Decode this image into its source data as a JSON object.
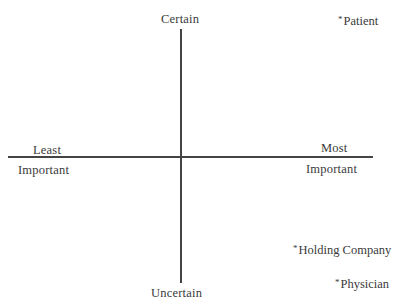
{
  "diagram": {
    "type": "quadrant",
    "axes": {
      "vertical": {
        "top_label": "Certain",
        "bottom_label": "Uncertain"
      },
      "horizontal": {
        "left_label_above": "Least",
        "left_label_below": "Important",
        "right_label_above": "Most",
        "right_label_below": "Important"
      }
    },
    "marker_glyph": "*",
    "points": [
      {
        "label": "Patient",
        "quadrant": "most-important-certain"
      },
      {
        "label": "Holding Company",
        "quadrant": "most-important-uncertain"
      },
      {
        "label": "Physician",
        "quadrant": "most-important-uncertain"
      }
    ],
    "colors": {
      "background": "#ffffff",
      "text": "#3a3a3a",
      "axis": "#444444"
    }
  }
}
